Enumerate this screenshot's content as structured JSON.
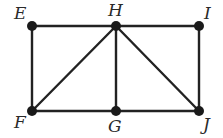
{
  "diagram": {
    "type": "graph",
    "colors": {
      "edge": "#222222",
      "node": "#1a1a1a",
      "label": "#2a2a2a",
      "background": "#ffffff"
    },
    "nodes": [
      {
        "id": "E",
        "label": "E",
        "x": 32,
        "y": 26,
        "lx": 14,
        "ly": 19
      },
      {
        "id": "H",
        "label": "H",
        "x": 116,
        "y": 26,
        "lx": 108,
        "ly": 16
      },
      {
        "id": "I",
        "label": "I",
        "x": 199,
        "y": 26,
        "lx": 204,
        "ly": 19
      },
      {
        "id": "F",
        "label": "F",
        "x": 32,
        "y": 111,
        "lx": 14,
        "ly": 128
      },
      {
        "id": "G",
        "label": "G",
        "x": 116,
        "y": 111,
        "lx": 108,
        "ly": 132
      },
      {
        "id": "J",
        "label": "J",
        "x": 199,
        "y": 111,
        "lx": 203,
        "ly": 130
      }
    ],
    "edges": [
      [
        "E",
        "H"
      ],
      [
        "H",
        "I"
      ],
      [
        "E",
        "F"
      ],
      [
        "F",
        "H"
      ],
      [
        "H",
        "G"
      ],
      [
        "H",
        "J"
      ],
      [
        "I",
        "J"
      ],
      [
        "F",
        "G"
      ],
      [
        "G",
        "J"
      ]
    ]
  }
}
